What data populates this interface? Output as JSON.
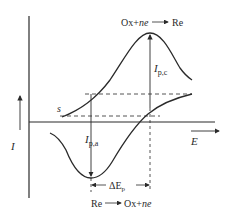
{
  "diagram": {
    "type": "cyclic-voltammogram",
    "axes": {
      "y_label": "I",
      "x_label": "E"
    },
    "reactions": {
      "cathodic": {
        "left": "Ox+",
        "ne": "ne",
        "arrow": "⟶",
        "right": "Re"
      },
      "anodic": {
        "left": "Re",
        "arrow": "⟶",
        "right": "Ox+",
        "ne": "ne"
      }
    },
    "labels": {
      "start": "s",
      "ip_c_main": "I",
      "ip_c_sub": "p,c",
      "ip_a_main": "I",
      "ip_a_sub": "p,a",
      "delta_ep_main": "ΔE",
      "delta_ep_sub": "p"
    },
    "colors": {
      "line": "#2a2a2a",
      "background": "#ffffff"
    }
  }
}
